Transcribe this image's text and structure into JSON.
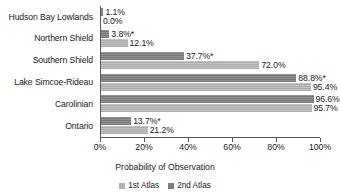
{
  "chart_data": {
    "type": "bar",
    "orientation": "horizontal",
    "title": "",
    "xlabel": "Probability of Observation",
    "ylabel": "",
    "xlim": [
      0,
      100
    ],
    "xunit": "%",
    "grid": false,
    "legend_position": "bottom",
    "categories": [
      "Hudson Bay Lowlands",
      "Northern Shield",
      "Southern Shield",
      "Lake Simcoe-Rideau",
      "Carolinian",
      "Ontario"
    ],
    "tick_labels": [
      "0%",
      "20%",
      "40%",
      "60%",
      "80%",
      "100%"
    ],
    "tick_values": [
      0,
      20,
      40,
      60,
      80,
      100
    ],
    "series": [
      {
        "name": "1st Atlas",
        "color": "#b2b2b2",
        "values": [
          0.0,
          12.1,
          72.0,
          95.4,
          95.7,
          21.2
        ],
        "labels": [
          "0.0%",
          "12.1%",
          "72.0%",
          "95.4%",
          "95.7%",
          "21.2%"
        ]
      },
      {
        "name": "2nd Atlas",
        "color": "#7d7d7d",
        "values": [
          1.1,
          3.8,
          37.7,
          88.8,
          96.6,
          13.7
        ],
        "labels": [
          "1.1%",
          "3.8%*",
          "37.7%*",
          "88.8%*",
          "96.6%",
          "13.7%*"
        ]
      }
    ]
  },
  "legend": {
    "items": [
      {
        "label": "1st Atlas"
      },
      {
        "label": "2nd Atlas"
      }
    ]
  }
}
